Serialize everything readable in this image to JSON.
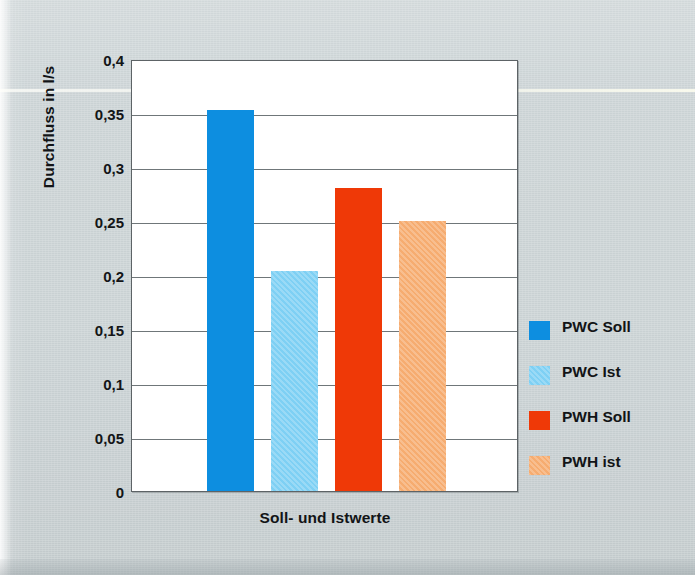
{
  "chart_data": {
    "type": "bar",
    "title": "",
    "subtitle": "",
    "xlabel": "Soll- und Istwerte",
    "ylabel": "Durchfluss in l/s",
    "categories": [
      "PWC Soll",
      "PWC Ist",
      "PWH Soll",
      "PWH ist"
    ],
    "values": [
      0.353,
      0.204,
      0.281,
      0.25
    ],
    "ylim": [
      0,
      0.4
    ],
    "ytick_values": [
      0,
      0.05,
      0.1,
      0.15,
      0.2,
      0.25,
      0.3,
      0.35,
      0.4
    ],
    "ytick_labels": [
      "0",
      "0,05",
      "0,1",
      "0,15",
      "0,2",
      "0,25",
      "0,3",
      "0,35",
      "0,4"
    ],
    "xtick_labels": [],
    "grid": "horizontal",
    "legend_position": "right",
    "series": [
      {
        "name": "PWC Soll",
        "value": 0.353,
        "color": "#0d8ee0"
      },
      {
        "name": "PWC Ist",
        "value": 0.204,
        "color": "#7ed0f4"
      },
      {
        "name": "PWH Soll",
        "value": 0.281,
        "color": "#ef3907"
      },
      {
        "name": "PWH ist",
        "value": 0.25,
        "color": "#f6ac70"
      }
    ]
  },
  "axes": {
    "y_title": "Durchfluss in l/s",
    "x_title": "Soll- und Istwerte",
    "y_ticks": [
      {
        "label": "0,4",
        "value": 0.4
      },
      {
        "label": "0,35",
        "value": 0.35
      },
      {
        "label": "0,3",
        "value": 0.3
      },
      {
        "label": "0,25",
        "value": 0.25
      },
      {
        "label": "0,2",
        "value": 0.2
      },
      {
        "label": "0,15",
        "value": 0.15
      },
      {
        "label": "0,1",
        "value": 0.1
      },
      {
        "label": "0,05",
        "value": 0.05
      },
      {
        "label": "0",
        "value": 0
      }
    ]
  },
  "legend": {
    "items": [
      {
        "label": "PWC Soll",
        "color": "#0d8ee0"
      },
      {
        "label": "PWC Ist",
        "color": "#7ed0f4"
      },
      {
        "label": "PWH Soll",
        "color": "#ef3907"
      },
      {
        "label": "PWH ist",
        "color": "#f6ac70"
      }
    ]
  },
  "colors": {
    "page_background": "#ccd4d6",
    "plot_background": "#ffffff",
    "plot_border": "#5d6366",
    "gridline": "#6f7679",
    "text": "#121416"
  }
}
